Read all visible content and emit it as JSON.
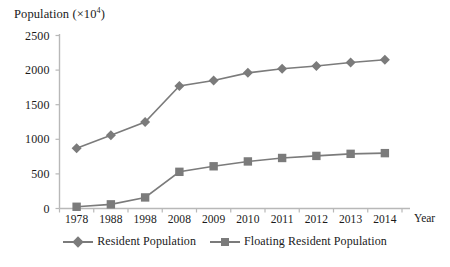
{
  "chart_data": {
    "type": "line",
    "title": "",
    "ylabel_prefix": "Population (×10",
    "ylabel_exponent": "4",
    "ylabel_suffix": ")",
    "xlabel": "Year",
    "categories": [
      "1978",
      "1988",
      "1998",
      "2008",
      "2009",
      "2010",
      "2011",
      "2012",
      "2013",
      "2014"
    ],
    "ylim": [
      0,
      2500
    ],
    "yticks": [
      0,
      500,
      1000,
      1500,
      2000,
      2500
    ],
    "ytick_labels": [
      "0",
      "500",
      "1000",
      "1500",
      "2000",
      "2500"
    ],
    "grid": false,
    "legend_position": "bottom",
    "series": [
      {
        "name": "Resident Population",
        "marker": "diamond",
        "color": "#7b7b7b",
        "values": [
          870,
          1060,
          1250,
          1770,
          1850,
          1960,
          2020,
          2060,
          2110,
          2150
        ]
      },
      {
        "name": "Floating Resident Population",
        "marker": "square",
        "color": "#7b7b7b",
        "values": [
          25,
          60,
          160,
          530,
          610,
          680,
          730,
          760,
          790,
          800
        ]
      }
    ]
  },
  "axis": {
    "line_color": "#b5b5b5",
    "text_color": "#1a1a1a"
  }
}
